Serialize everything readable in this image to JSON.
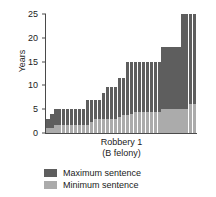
{
  "chart_data": {
    "type": "bar",
    "title": "",
    "xlabel": "Robbery 1",
    "xlabel_line2": "(B felony)",
    "ylabel": "Years",
    "ylim": [
      0,
      25
    ],
    "yticks": [
      0,
      5,
      10,
      15,
      20,
      25
    ],
    "grid": false,
    "legend_position": "bottom-center",
    "stacked": true,
    "categories": [
      "1",
      "2",
      "3",
      "4",
      "5",
      "6",
      "7",
      "8",
      "9",
      "10",
      "11",
      "12",
      "13",
      "14",
      "15",
      "16",
      "17",
      "18",
      "19",
      "20",
      "21",
      "22",
      "23",
      "24",
      "25",
      "26",
      "27",
      "28",
      "29",
      "30",
      "31",
      "32",
      "33",
      "34",
      "35",
      "36",
      "37",
      "38"
    ],
    "series": [
      {
        "name": "Maximum sentence",
        "color": "#5e5e5e",
        "values": [
          3,
          4,
          5,
          5,
          5,
          5,
          5,
          5,
          5,
          5,
          7,
          7,
          7,
          7,
          8.5,
          9.75,
          9.75,
          9.75,
          11.5,
          11.5,
          15,
          15,
          15,
          15,
          15,
          15,
          15,
          15,
          15,
          18,
          18,
          18,
          18,
          18,
          25,
          25,
          25,
          25
        ]
      },
      {
        "name": "Minimum sentence",
        "color": "#ababab",
        "values": [
          1,
          1,
          1.66,
          1.66,
          1.66,
          1.66,
          1.66,
          1.66,
          1.66,
          1.66,
          1.66,
          2.33,
          3,
          3,
          3,
          3,
          3,
          3,
          3.33,
          3.83,
          3.83,
          4,
          4.5,
          4.5,
          4.5,
          4.5,
          4.5,
          4.5,
          4.5,
          5,
          5,
          5,
          5,
          5,
          5,
          5,
          6,
          6
        ]
      }
    ]
  },
  "legend": {
    "items": [
      {
        "label": "Maximum sentence",
        "color": "#5e5e5e"
      },
      {
        "label": "Minimum sentence",
        "color": "#ababab"
      }
    ]
  }
}
